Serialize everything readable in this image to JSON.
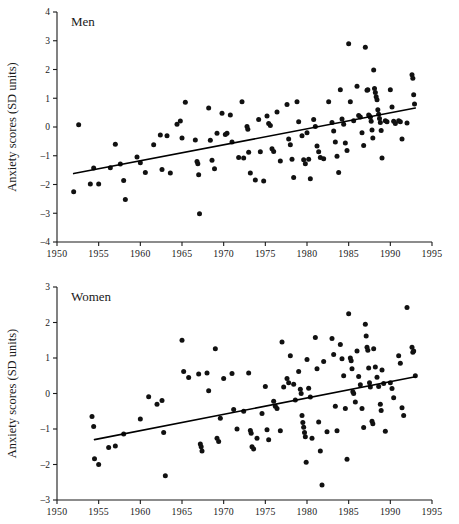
{
  "figure": {
    "y_axis_label": "Anxiety scores (SD units)",
    "panels": [
      "Men",
      "Women"
    ]
  },
  "chart_data": [
    {
      "type": "scatter",
      "title": "Men",
      "xlabel": "",
      "ylabel": "Anxiety scores (SD units)",
      "xlim": [
        1950,
        1995
      ],
      "ylim": [
        -4,
        4
      ],
      "xticks": [
        1950,
        1955,
        1960,
        1965,
        1970,
        1975,
        1980,
        1985,
        1990,
        1995
      ],
      "xtick_labels": [
        "1950",
        "1955",
        "1960",
        "1965",
        "1970",
        "1975",
        "1980",
        "1985",
        "1990",
        "1995"
      ],
      "yticks": [
        -4,
        -3,
        -2,
        -1,
        0,
        1,
        2,
        3,
        4
      ],
      "ytick_labels": [
        "-4",
        "-3",
        "-2",
        "-1",
        "0",
        "1",
        "2",
        "3",
        "4"
      ],
      "grid": false,
      "legend": "none",
      "trendline": {
        "x": [
          1952.0,
          1993.0
        ],
        "y": [
          -1.62,
          0.66
        ]
      },
      "points": [
        [
          1952.0,
          -2.25
        ],
        [
          1952.6,
          0.08
        ],
        [
          1954.0,
          -1.98
        ],
        [
          1954.4,
          -1.43
        ],
        [
          1955.0,
          -1.98
        ],
        [
          1956.4,
          -1.42
        ],
        [
          1957.0,
          -0.6
        ],
        [
          1957.6,
          -1.29
        ],
        [
          1958.0,
          -1.86
        ],
        [
          1958.2,
          -2.52
        ],
        [
          1959.6,
          -1.04
        ],
        [
          1960.0,
          -1.24
        ],
        [
          1960.6,
          -1.58
        ],
        [
          1961.6,
          -0.62
        ],
        [
          1962.4,
          -0.28
        ],
        [
          1962.6,
          -1.48
        ],
        [
          1963.2,
          -0.3
        ],
        [
          1963.6,
          -1.6
        ],
        [
          1964.4,
          0.1
        ],
        [
          1964.8,
          0.21
        ],
        [
          1965.0,
          -0.38
        ],
        [
          1965.4,
          0.86
        ],
        [
          1966.6,
          -0.45
        ],
        [
          1966.8,
          -1.2
        ],
        [
          1966.9,
          -1.28
        ],
        [
          1967.0,
          -1.66
        ],
        [
          1967.1,
          -3.02
        ],
        [
          1968.2,
          0.66
        ],
        [
          1968.4,
          -0.46
        ],
        [
          1968.6,
          -1.16
        ],
        [
          1968.9,
          -1.45
        ],
        [
          1969.2,
          -0.22
        ],
        [
          1969.8,
          0.48
        ],
        [
          1970.2,
          -0.26
        ],
        [
          1970.4,
          -0.22
        ],
        [
          1970.8,
          0.42
        ],
        [
          1971.0,
          -0.52
        ],
        [
          1971.8,
          -1.06
        ],
        [
          1972.2,
          0.88
        ],
        [
          1972.4,
          -1.08
        ],
        [
          1972.8,
          0.02
        ],
        [
          1972.9,
          -0.08
        ],
        [
          1973.0,
          -0.88
        ],
        [
          1973.2,
          -1.6
        ],
        [
          1973.8,
          -1.84
        ],
        [
          1974.2,
          0.26
        ],
        [
          1974.4,
          -0.86
        ],
        [
          1974.8,
          -1.88
        ],
        [
          1975.2,
          0.38
        ],
        [
          1975.4,
          0.12
        ],
        [
          1975.6,
          0.05
        ],
        [
          1975.8,
          -0.76
        ],
        [
          1976.0,
          -0.85
        ],
        [
          1976.4,
          0.52
        ],
        [
          1976.8,
          -1.18
        ],
        [
          1977.6,
          0.78
        ],
        [
          1977.8,
          -0.42
        ],
        [
          1978.0,
          -0.62
        ],
        [
          1978.2,
          -1.12
        ],
        [
          1978.4,
          -1.76
        ],
        [
          1978.8,
          0.88
        ],
        [
          1979.0,
          0.18
        ],
        [
          1979.4,
          -0.3
        ],
        [
          1979.6,
          -1.14
        ],
        [
          1979.8,
          -1.28
        ],
        [
          1980.0,
          -0.2
        ],
        [
          1980.2,
          -1.12
        ],
        [
          1980.4,
          -1.8
        ],
        [
          1980.8,
          0.26
        ],
        [
          1981.0,
          0.02
        ],
        [
          1981.2,
          -0.66
        ],
        [
          1981.4,
          -0.86
        ],
        [
          1981.6,
          -1.06
        ],
        [
          1982.0,
          -1.1
        ],
        [
          1982.6,
          0.88
        ],
        [
          1983.0,
          0.16
        ],
        [
          1983.2,
          -0.14
        ],
        [
          1983.4,
          -0.52
        ],
        [
          1983.6,
          -1.02
        ],
        [
          1983.8,
          -1.58
        ],
        [
          1984.0,
          1.3
        ],
        [
          1984.2,
          0.28
        ],
        [
          1984.4,
          0.1
        ],
        [
          1984.6,
          -0.56
        ],
        [
          1984.8,
          -0.82
        ],
        [
          1985.0,
          2.9
        ],
        [
          1985.2,
          0.88
        ],
        [
          1985.6,
          0.22
        ],
        [
          1986.0,
          1.42
        ],
        [
          1986.2,
          0.4
        ],
        [
          1986.4,
          0.35
        ],
        [
          1986.6,
          -0.2
        ],
        [
          1986.8,
          -0.64
        ],
        [
          1987.0,
          2.77
        ],
        [
          1987.2,
          1.28
        ],
        [
          1987.3,
          1.3
        ],
        [
          1987.4,
          0.42
        ],
        [
          1987.5,
          0.38
        ],
        [
          1987.6,
          0.34
        ],
        [
          1987.7,
          0.2
        ],
        [
          1987.8,
          -0.1
        ],
        [
          1987.9,
          -0.38
        ],
        [
          1988.0,
          1.98
        ],
        [
          1988.1,
          1.34
        ],
        [
          1988.2,
          1.2
        ],
        [
          1988.3,
          1.05
        ],
        [
          1988.4,
          0.95
        ],
        [
          1988.5,
          0.6
        ],
        [
          1988.6,
          0.44
        ],
        [
          1988.7,
          0.3
        ],
        [
          1988.8,
          0.16
        ],
        [
          1988.9,
          -0.12
        ],
        [
          1989.0,
          -1.08
        ],
        [
          1989.4,
          0.22
        ],
        [
          1989.6,
          0.18
        ],
        [
          1990.0,
          1.3
        ],
        [
          1990.2,
          0.7
        ],
        [
          1990.4,
          0.2
        ],
        [
          1990.6,
          0.12
        ],
        [
          1991.0,
          0.22
        ],
        [
          1991.2,
          0.18
        ],
        [
          1991.4,
          -0.42
        ],
        [
          1992.0,
          0.14
        ],
        [
          1992.6,
          1.82
        ],
        [
          1992.7,
          1.7
        ],
        [
          1992.8,
          1.12
        ],
        [
          1992.9,
          0.8
        ]
      ]
    },
    {
      "type": "scatter",
      "title": "Women",
      "xlabel": "",
      "ylabel": "Anxiety scores (SD units)",
      "xlim": [
        1950,
        1995
      ],
      "ylim": [
        -3,
        3
      ],
      "xticks": [
        1950,
        1955,
        1960,
        1965,
        1970,
        1975,
        1980,
        1985,
        1990,
        1995
      ],
      "xtick_labels": [
        "1950",
        "1955",
        "1960",
        "1965",
        "1970",
        "1975",
        "1980",
        "1985",
        "1990",
        "1995"
      ],
      "yticks": [
        -3,
        -2,
        -1,
        0,
        1,
        2,
        3
      ],
      "ytick_labels": [
        "-3",
        "-2",
        "-1",
        "0",
        "1",
        "2",
        "3"
      ],
      "grid": false,
      "legend": "none",
      "trendline": {
        "x": [
          1954.5,
          1993.0
        ],
        "y": [
          -1.3,
          0.47
        ]
      },
      "points": [
        [
          1954.2,
          -0.65
        ],
        [
          1954.4,
          -0.93
        ],
        [
          1954.5,
          -1.84
        ],
        [
          1955.0,
          -2.0
        ],
        [
          1956.2,
          -1.52
        ],
        [
          1957.0,
          -1.48
        ],
        [
          1958.0,
          -1.14
        ],
        [
          1960.0,
          -0.72
        ],
        [
          1961.0,
          -0.09
        ],
        [
          1962.0,
          -0.3
        ],
        [
          1962.6,
          -0.2
        ],
        [
          1962.8,
          -1.1
        ],
        [
          1963.0,
          -2.32
        ],
        [
          1965.0,
          1.5
        ],
        [
          1965.2,
          0.62
        ],
        [
          1965.8,
          0.45
        ],
        [
          1967.0,
          0.55
        ],
        [
          1967.2,
          -1.42
        ],
        [
          1967.3,
          -1.5
        ],
        [
          1967.4,
          -1.62
        ],
        [
          1968.0,
          0.58
        ],
        [
          1968.2,
          0.08
        ],
        [
          1969.0,
          1.26
        ],
        [
          1969.2,
          -1.26
        ],
        [
          1969.4,
          -1.35
        ],
        [
          1969.6,
          -0.7
        ],
        [
          1970.0,
          0.42
        ],
        [
          1971.0,
          0.56
        ],
        [
          1971.2,
          -0.45
        ],
        [
          1971.6,
          -1.0
        ],
        [
          1972.4,
          -0.5
        ],
        [
          1973.0,
          0.58
        ],
        [
          1973.2,
          -1.04
        ],
        [
          1973.3,
          -1.12
        ],
        [
          1973.4,
          -1.5
        ],
        [
          1973.6,
          -1.56
        ],
        [
          1974.0,
          -1.26
        ],
        [
          1974.6,
          -0.56
        ],
        [
          1975.0,
          0.2
        ],
        [
          1975.2,
          -1.02
        ],
        [
          1975.4,
          -1.3
        ],
        [
          1976.0,
          -0.22
        ],
        [
          1976.2,
          -0.36
        ],
        [
          1976.4,
          -0.42
        ],
        [
          1976.8,
          -1.05
        ],
        [
          1977.0,
          1.45
        ],
        [
          1977.2,
          0.18
        ],
        [
          1977.6,
          0.42
        ],
        [
          1977.8,
          0.3
        ],
        [
          1978.0,
          1.06
        ],
        [
          1978.4,
          0.26
        ],
        [
          1978.6,
          -0.18
        ],
        [
          1979.0,
          0.62
        ],
        [
          1979.2,
          0.12
        ],
        [
          1979.3,
          0.0
        ],
        [
          1979.4,
          -0.62
        ],
        [
          1979.5,
          -0.82
        ],
        [
          1979.6,
          -0.95
        ],
        [
          1979.7,
          -1.1
        ],
        [
          1979.8,
          -1.22
        ],
        [
          1979.9,
          -1.94
        ],
        [
          1980.0,
          0.96
        ],
        [
          1980.2,
          0.15
        ],
        [
          1980.4,
          -0.1
        ],
        [
          1980.6,
          -1.26
        ],
        [
          1981.0,
          1.58
        ],
        [
          1981.2,
          0.7
        ],
        [
          1981.4,
          -0.8
        ],
        [
          1981.6,
          -1.62
        ],
        [
          1981.8,
          -2.58
        ],
        [
          1982.0,
          0.9
        ],
        [
          1982.4,
          -1.08
        ],
        [
          1983.0,
          1.55
        ],
        [
          1983.2,
          1.1
        ],
        [
          1983.4,
          -0.36
        ],
        [
          1983.6,
          -1.05
        ],
        [
          1984.0,
          1.38
        ],
        [
          1984.2,
          0.98
        ],
        [
          1984.4,
          0.5
        ],
        [
          1984.6,
          -0.42
        ],
        [
          1984.8,
          -1.85
        ],
        [
          1985.0,
          2.25
        ],
        [
          1985.2,
          1.0
        ],
        [
          1985.3,
          0.92
        ],
        [
          1985.4,
          0.7
        ],
        [
          1985.5,
          0.05
        ],
        [
          1985.6,
          0.0
        ],
        [
          1985.8,
          -0.24
        ],
        [
          1986.0,
          1.2
        ],
        [
          1986.2,
          0.48
        ],
        [
          1986.4,
          0.25
        ],
        [
          1986.6,
          -0.42
        ],
        [
          1986.8,
          -0.96
        ],
        [
          1987.0,
          1.95
        ],
        [
          1987.1,
          1.62
        ],
        [
          1987.2,
          1.3
        ],
        [
          1987.3,
          1.22
        ],
        [
          1987.4,
          0.72
        ],
        [
          1987.5,
          0.3
        ],
        [
          1987.6,
          0.18
        ],
        [
          1987.8,
          -0.78
        ],
        [
          1987.9,
          -0.85
        ],
        [
          1988.0,
          1.26
        ],
        [
          1988.2,
          0.75
        ],
        [
          1988.4,
          0.46
        ],
        [
          1988.6,
          0.2
        ],
        [
          1988.8,
          -0.3
        ],
        [
          1988.9,
          -0.48
        ],
        [
          1989.0,
          0.66
        ],
        [
          1989.2,
          0.28
        ],
        [
          1989.4,
          -1.06
        ],
        [
          1990.0,
          0.3
        ],
        [
          1990.2,
          0.14
        ],
        [
          1990.4,
          -0.12
        ],
        [
          1991.0,
          1.06
        ],
        [
          1991.2,
          0.85
        ],
        [
          1991.4,
          -0.4
        ],
        [
          1991.6,
          -0.62
        ],
        [
          1992.0,
          2.42
        ],
        [
          1992.6,
          1.3
        ],
        [
          1992.7,
          1.16
        ],
        [
          1992.8,
          1.2
        ],
        [
          1993.0,
          0.5
        ]
      ]
    }
  ]
}
